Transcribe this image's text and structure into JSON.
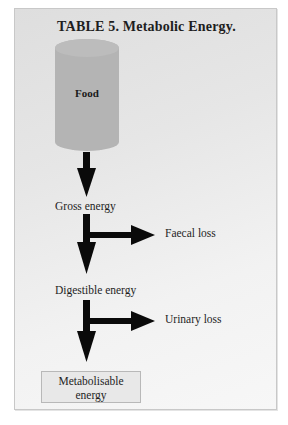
{
  "title": "TABLE 5. Metabolic Energy.",
  "nodes": {
    "food": "Food",
    "gross_energy": "Gross energy",
    "digestible_energy": "Digestible energy",
    "metabolisable_energy_line1": "Metabolisable",
    "metabolisable_energy_line2": "energy"
  },
  "losses": {
    "faecal": "Faecal loss",
    "urinary": "Urinary loss"
  },
  "flow": [
    {
      "from": "Food",
      "to": "Gross energy"
    },
    {
      "from": "Gross energy",
      "to": "Digestible energy",
      "branch": "Faecal loss"
    },
    {
      "from": "Digestible energy",
      "to": "Metabolisable energy",
      "branch": "Urinary loss"
    }
  ],
  "colors": {
    "cylinder": "#b4b4b4",
    "arrow": "#0a0a0a",
    "panel_border": "#c8c8c8"
  }
}
